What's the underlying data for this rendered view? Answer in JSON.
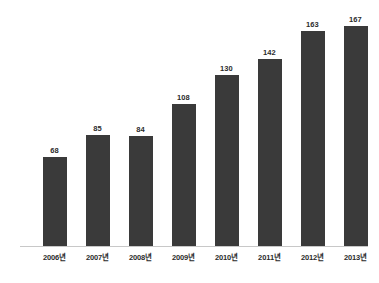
{
  "chart_data": {
    "type": "bar",
    "title": "",
    "subtitle": "",
    "xlabel": "",
    "ylabel": "",
    "categories": [
      "2006년",
      "2007년",
      "2008년",
      "2009년",
      "2010년",
      "2011년",
      "2012년",
      "2013년"
    ],
    "values": [
      68,
      85,
      84,
      108,
      130,
      142,
      163,
      167
    ],
    "data_labels": [
      "68",
      "85",
      "84",
      "108",
      "130",
      "142",
      "163",
      "167"
    ],
    "series": [
      {
        "name": "",
        "values": [
          68,
          85,
          84,
          108,
          130,
          142,
          163,
          167
        ]
      }
    ],
    "ylim": [
      0,
      167
    ],
    "grid": false,
    "legend": false,
    "legend_position": "none",
    "annotations": [],
    "colors": {
      "bar": "#3a3a3a",
      "label_text": "#2b2b2b",
      "axis_line": "#c8c8c8",
      "background": "#ffffff"
    }
  }
}
